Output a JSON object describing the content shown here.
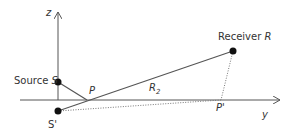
{
  "diagram": {
    "type": "image-source reflection geometry",
    "axes": {
      "vertical": {
        "label": "z"
      },
      "horizontal": {
        "label": "y"
      }
    },
    "points": {
      "source": {
        "label_prefix": "Source",
        "label_symbol": "S",
        "x": 58,
        "y": 82
      },
      "image_source": {
        "label": "S'",
        "x": 58,
        "y": 111
      },
      "reflection_point": {
        "label": "P",
        "x": 87,
        "y": 100
      },
      "receiver": {
        "label_prefix": "Receiver",
        "label_symbol": "R",
        "x": 233,
        "y": 51
      },
      "projection_point": {
        "label": "P'",
        "x": 221,
        "y": 100
      }
    },
    "segments": [
      {
        "from": "source",
        "to": "reflection_point",
        "style": "solid"
      },
      {
        "from": "image_source",
        "to": "receiver",
        "style": "solid",
        "label": "R",
        "label_sub": "2"
      },
      {
        "from": "image_source",
        "to": "projection_point",
        "style": "dotted"
      },
      {
        "from": "receiver",
        "to": "projection_point",
        "style": "dotted"
      }
    ],
    "colors": {
      "line": "#555555",
      "point": "#111111",
      "text": "#333333"
    }
  }
}
